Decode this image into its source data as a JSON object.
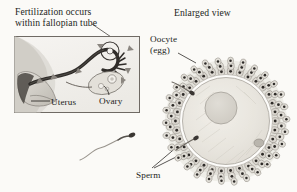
{
  "figure": {
    "background_color": "#fbfaf7",
    "ink_color": "#231f1c",
    "type": "biology-illustration"
  },
  "panels": {
    "left": {
      "title": "Fertilization occurs\nwithin fallopian tube",
      "title_line_1": "Fertilization occurs",
      "title_line_2": "within fallopian tube",
      "inset_box": {
        "x": 14,
        "y": 36,
        "width": 126,
        "height": 77,
        "border_color": "#6f6a64",
        "fill_color": "#f2f0ec"
      },
      "labels": [
        {
          "id": "uterus",
          "text": "Uterus",
          "leader": "horizontal-left"
        },
        {
          "id": "ovary",
          "text": "Ovary",
          "leader": "curve-up"
        }
      ],
      "annotation_target": "fertilization-site-circle"
    },
    "right": {
      "title": "Enlarged view",
      "labels": [
        {
          "id": "oocyte",
          "text": "Oocyte\n(egg)",
          "line_1": "Oocyte",
          "line_2": "(egg)",
          "leader": "diagonal-down-right"
        }
      ]
    }
  },
  "shared_labels": [
    {
      "id": "sperm",
      "text": "Sperm",
      "leader_count": 2
    }
  ],
  "structures": {
    "uterus": {
      "name": "Uterus",
      "shade": "#c8c4bd"
    },
    "fallopian_tube": {
      "name": "Fallopian tube",
      "shade": "#3b3734"
    },
    "ovary": {
      "name": "Ovary",
      "shade": "#d9d5ce"
    },
    "fertilization_site": {
      "name": "Fertilization site",
      "marker": "circle"
    },
    "oocyte": {
      "name": "Oocyte (egg)",
      "shade": "#e9e6e0"
    },
    "nucleus": {
      "name": "Nucleus",
      "shade": "#d8d4cd"
    },
    "polar_body": {
      "name": "Polar body",
      "shade": "#c5c1ba"
    },
    "zona_pellucida": {
      "name": "Zona pellucida",
      "shade": "#ffffff"
    },
    "corona_radiata": {
      "name": "Corona radiata",
      "shade": "#b9b5ad",
      "cell_count": 96
    },
    "sperm_free": {
      "name": "Free sperm",
      "count": 1
    },
    "sperm_penetrating": {
      "name": "Penetrating sperm",
      "count": 2
    }
  }
}
